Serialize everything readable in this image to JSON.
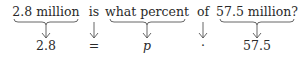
{
  "phrases": [
    {
      "text": "2.8 million",
      "braced": true,
      "x": 46
    },
    {
      "text": "is",
      "braced": false,
      "x": 94
    },
    {
      "text": "what percent",
      "braced": true,
      "x": 147
    },
    {
      "text": "of",
      "braced": false,
      "x": 203
    },
    {
      "text": "57.5 million?",
      "braced": true,
      "x": 257
    }
  ],
  "translation": [
    {
      "text": "2.8",
      "x": 46
    },
    {
      "text": "=",
      "x": 94
    },
    {
      "text": "p",
      "x": 147,
      "italic": true
    },
    {
      "text": "·",
      "x": 203
    },
    {
      "text": "57.5",
      "x": 257
    }
  ],
  "colors": {
    "text": "#2a2a2a",
    "lines": "#555555"
  }
}
